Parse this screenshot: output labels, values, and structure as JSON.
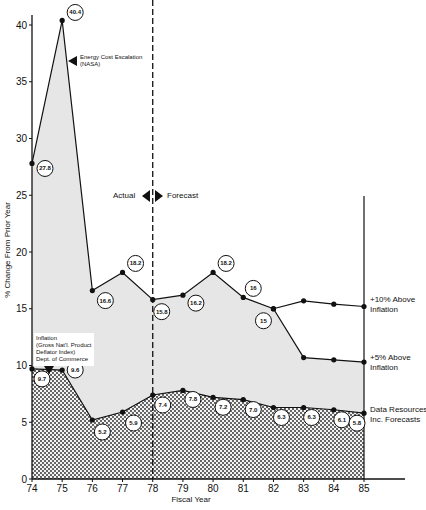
{
  "chart_data": {
    "type": "area",
    "title": "",
    "xlabel": "Fiscal Year",
    "ylabel": "% Change From Prior Year",
    "x": [
      "74",
      "75",
      "76",
      "77",
      "78",
      "79",
      "80",
      "81",
      "82",
      "83",
      "84",
      "85"
    ],
    "xlim": [
      74,
      85
    ],
    "ylim": [
      0,
      40
    ],
    "yticks": [
      0,
      5,
      10,
      15,
      20,
      25,
      30,
      35,
      40
    ],
    "grid": false,
    "divider": {
      "x": "78",
      "left_label": "Actual",
      "right_label": "Forecast"
    },
    "series": [
      {
        "name": "Energy Cost Escalation (NASA)",
        "x": [
          "74",
          "75",
          "76",
          "77",
          "78",
          "79",
          "80",
          "81",
          "82"
        ],
        "values": [
          27.8,
          40.4,
          16.6,
          18.2,
          15.8,
          16.2,
          18.2,
          16,
          15
        ]
      },
      {
        "name": "+10% Above Inflation",
        "x": [
          "82",
          "83",
          "84",
          "85"
        ],
        "values": [
          15,
          15.7,
          15.4,
          15.2
        ]
      },
      {
        "name": "+5% Above Inflation",
        "x": [
          "82",
          "83",
          "84",
          "85"
        ],
        "values": [
          15,
          10.7,
          10.5,
          10.3
        ]
      },
      {
        "name": "Inflation (Gross Nat'l. Product Deflator Index) Dept. of Commerce / Data Resources Inc. Forecasts",
        "x": [
          "74",
          "75",
          "76",
          "77",
          "78",
          "79",
          "80",
          "81",
          "82",
          "83",
          "84",
          "85"
        ],
        "values": [
          9.7,
          9.6,
          5.2,
          5.9,
          7.4,
          7.8,
          7.2,
          7.0,
          6.3,
          6.3,
          6.1,
          5.8
        ]
      }
    ],
    "annotations": [
      "Energy Cost Escalation (NASA)",
      "Inflation (Gross Nat'l. Product Deflator Index) Dept. of Commerce",
      "Actual",
      "Forecast",
      "+10% Above Inflation",
      "+5% Above Inflation",
      "Data Resources Inc. Forecasts"
    ]
  },
  "labels": {
    "energy_line1": "Energy Cost Escalation",
    "energy_line2": "(NASA)",
    "inflation_line1": "Inflation",
    "inflation_line2": "(Gross Nat'l. Product",
    "inflation_line3": "Deflator Index)",
    "inflation_line4": "Dept. of Commerce",
    "actual": "Actual",
    "forecast": "Forecast",
    "plus10_line1": "+10% Above",
    "plus10_line2": "Inflation",
    "plus5_line1": "+5% Above",
    "plus5_line2": "Inflation",
    "dri_line1": "Data Resources",
    "dri_line2": "Inc. Forecasts",
    "xlabel": "Fiscal Year",
    "ylabel": "% Change From Prior Year"
  },
  "bubbles": {
    "energy": [
      "27.8",
      "40.4",
      "16.6",
      "18.2",
      "15.8",
      "16.2",
      "18.2",
      "16",
      "15"
    ],
    "inflation": [
      "9.7",
      "9.6",
      "5.2",
      "5.9",
      "7.4",
      "7.8",
      "7.2",
      "7.0",
      "6.3",
      "6.3",
      "6.1",
      "5.8"
    ]
  }
}
